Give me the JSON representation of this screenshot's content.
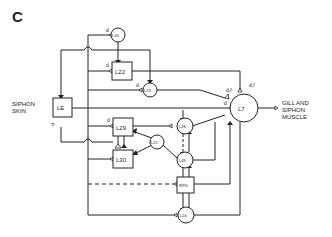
{
  "panel_label": "C",
  "labels": {
    "siphon_skin_1": "SIPHON",
    "siphon_skin_2": "SKIN",
    "question": "?",
    "gill_1": "GILL AND",
    "gill_2": "SIPHON",
    "gill_3": "MUSCLE",
    "d": "d",
    "df": "d,f",
    "df2": "d,f"
  },
  "neurons": {
    "le": "LE",
    "l16": "L16",
    "l22": "L22",
    "l23": "L23",
    "l29": "L29",
    "l30": "L30",
    "l21": "L21",
    "l28": "L28",
    "l49": "L49",
    "rpg": "RPG",
    "l24": "L24",
    "l7": "L7"
  },
  "colors": {
    "ink": "#222222",
    "background": "#ffffff"
  }
}
